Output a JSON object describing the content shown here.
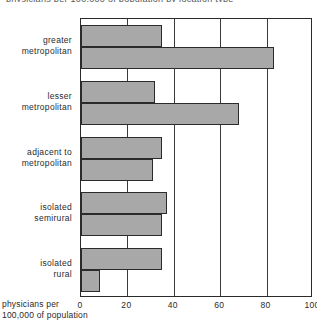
{
  "title_sliver": "physicians per 100,000 of population by location type",
  "axis_caption": {
    "line1": "physicians per",
    "line2": "100,000 of population"
  },
  "chart_data": {
    "type": "bar",
    "orientation": "horizontal",
    "title": "",
    "xlabel": "physicians per 100,000 of population",
    "ylabel": "",
    "xlim": [
      0,
      100
    ],
    "xticks": [
      "0",
      "20",
      "40",
      "60",
      "80",
      "100"
    ],
    "xtick_values": [
      0,
      20,
      40,
      60,
      80,
      100
    ],
    "grid": true,
    "legend": "none",
    "categories": [
      "greater metropolitan",
      "lesser metropolitan",
      "adjacent to metropolitan",
      "isolated semirural",
      "isolated rural"
    ],
    "category_lines": [
      [
        "greater",
        "metropolitan"
      ],
      [
        "lesser",
        "metropolitan"
      ],
      [
        "adjacent to",
        "metropolitan"
      ],
      [
        "isolated",
        "semirural"
      ],
      [
        "isolated",
        "rural"
      ]
    ],
    "series": [
      {
        "name": "series-1",
        "values": [
          35,
          32,
          35,
          37,
          35
        ]
      },
      {
        "name": "series-2",
        "values": [
          83,
          68,
          31,
          35,
          8
        ]
      }
    ],
    "bar_color": "#a8a8a8",
    "bar_edge_color": "#2b2b2b",
    "grid_color": "#3a3a3a"
  }
}
